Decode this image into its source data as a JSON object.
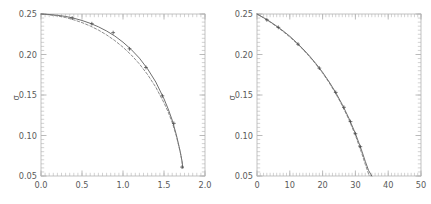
{
  "figure": {
    "background_color": "#ffffff",
    "axis_color": "#b4b4b4",
    "tick_label_color": "#5a5a5a",
    "curve_solid_color": "#555555",
    "curve_dashed_color": "#777777",
    "marker_color": "#4a4a4a",
    "panel_count": 2
  },
  "chart_data": [
    {
      "type": "line",
      "panel": "left",
      "title": "",
      "xlabel": "",
      "ylabel": "σ",
      "xlim": [
        0.0,
        2.0
      ],
      "ylim": [
        0.05,
        0.25
      ],
      "xticks": [
        0.0,
        0.5,
        1.0,
        1.5,
        2.0
      ],
      "xticklabels": [
        "0.0",
        "0.5",
        "1.0",
        "1.5",
        "2.0"
      ],
      "yticks": [
        0.05,
        0.1,
        0.15,
        0.2,
        0.25
      ],
      "yticklabels": [
        "0.05",
        "0.10",
        "0.15",
        "0.20",
        "0.25"
      ],
      "minor_ticks": true,
      "minor_ticks_per_major_x": 10,
      "minor_ticks_per_major_y": 10,
      "grid": false,
      "legend": null,
      "frame": "box",
      "tick_direction": "in",
      "series": [
        {
          "name": "solid",
          "style": "solid",
          "x": [
            0.0,
            0.1,
            0.2,
            0.3,
            0.4,
            0.5,
            0.6,
            0.7,
            0.8,
            0.9,
            1.0,
            1.1,
            1.2,
            1.3,
            1.4,
            1.5,
            1.55,
            1.6,
            1.65,
            1.68,
            1.7,
            1.72,
            1.73
          ],
          "y": [
            0.25,
            0.2494,
            0.2484,
            0.247,
            0.2448,
            0.242,
            0.2385,
            0.2342,
            0.229,
            0.2228,
            0.2152,
            0.2062,
            0.1955,
            0.1822,
            0.166,
            0.1452,
            0.133,
            0.119,
            0.101,
            0.088,
            0.079,
            0.068,
            0.06
          ]
        },
        {
          "name": "dashed",
          "style": "dashed",
          "x": [
            0.0,
            0.1,
            0.2,
            0.3,
            0.4,
            0.5,
            0.6,
            0.7,
            0.8,
            0.9,
            1.0,
            1.1,
            1.2,
            1.3,
            1.4,
            1.5,
            1.55,
            1.6,
            1.65,
            1.68,
            1.7,
            1.72,
            1.73
          ],
          "y": [
            0.25,
            0.249,
            0.2476,
            0.2456,
            0.2428,
            0.2394,
            0.2352,
            0.2302,
            0.2242,
            0.2172,
            0.209,
            0.1995,
            0.1884,
            0.1752,
            0.1596,
            0.1404,
            0.1292,
            0.1162,
            0.0995,
            0.0872,
            0.0785,
            0.0678,
            0.06
          ]
        }
      ],
      "markers": {
        "symbol": "cross",
        "x": [
          0.38,
          0.62,
          0.88,
          1.08,
          1.28,
          1.48,
          1.62,
          1.72
        ],
        "y": [
          0.245,
          0.238,
          0.227,
          0.207,
          0.184,
          0.149,
          0.115,
          0.061
        ]
      }
    },
    {
      "type": "line",
      "panel": "right",
      "title": "",
      "xlabel": "",
      "ylabel": "σ",
      "xlim": [
        0,
        50
      ],
      "ylim": [
        0.05,
        0.25
      ],
      "xticks": [
        0,
        10,
        20,
        30,
        40,
        50
      ],
      "xticklabels": [
        "0",
        "10",
        "20",
        "30",
        "40",
        "50"
      ],
      "yticks": [
        0.05,
        0.1,
        0.15,
        0.2,
        0.25
      ],
      "yticklabels": [
        "0.05",
        "0.10",
        "0.15",
        "0.20",
        "0.25"
      ],
      "minor_ticks": true,
      "minor_ticks_per_major_x": 10,
      "minor_ticks_per_major_y": 10,
      "grid": false,
      "legend": null,
      "frame": "box",
      "tick_direction": "in",
      "series": [
        {
          "name": "solid",
          "style": "solid",
          "x": [
            0,
            2,
            4,
            6,
            8,
            10,
            12,
            14,
            16,
            18,
            20,
            22,
            24,
            26,
            28,
            30,
            32,
            33,
            34,
            35
          ],
          "y": [
            0.25,
            0.2455,
            0.2405,
            0.235,
            0.229,
            0.2225,
            0.215,
            0.207,
            0.1982,
            0.1885,
            0.178,
            0.1662,
            0.153,
            0.1382,
            0.1215,
            0.1025,
            0.0805,
            0.0682,
            0.057,
            0.05
          ]
        },
        {
          "name": "dashed",
          "style": "dashed",
          "x": [
            0,
            2,
            4,
            6,
            8,
            10,
            12,
            14,
            16,
            18,
            20,
            22,
            24,
            26,
            28,
            30,
            32,
            33,
            34,
            34.6
          ],
          "y": [
            0.25,
            0.2452,
            0.24,
            0.2344,
            0.2282,
            0.2216,
            0.2142,
            0.2062,
            0.1974,
            0.1878,
            0.1772,
            0.1652,
            0.1518,
            0.1368,
            0.1198,
            0.1002,
            0.0772,
            0.0645,
            0.0528,
            0.05
          ]
        }
      ],
      "markers": {
        "symbol": "cross",
        "x": [
          3.0,
          6.5,
          12.5,
          19.0,
          24.0,
          26.5,
          28.5,
          30.0,
          31.5
        ],
        "y": [
          0.2428,
          0.2335,
          0.2128,
          0.1832,
          0.1532,
          0.1348,
          0.1172,
          0.1022,
          0.0862
        ]
      }
    }
  ]
}
